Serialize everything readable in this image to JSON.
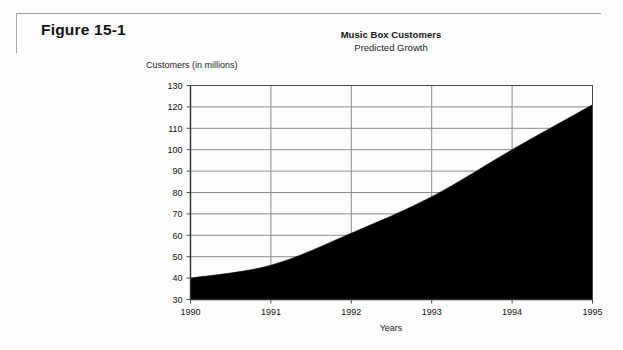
{
  "figure": {
    "label": "Figure 15-1"
  },
  "chart_data": {
    "type": "area",
    "title": "Music Box Customers",
    "subtitle": "Predicted Growth",
    "xlabel": "Years",
    "ylabel": "Customers (in millions)",
    "categories": [
      "1990",
      "1991",
      "1992",
      "1993",
      "1994",
      "1995"
    ],
    "x": [
      1990,
      1991,
      1992,
      1993,
      1994,
      1995
    ],
    "values": [
      40,
      46,
      61,
      78,
      100,
      121
    ],
    "series": [
      {
        "name": "Music Box Customers",
        "values": [
          40,
          46,
          61,
          78,
          100,
          121
        ]
      }
    ],
    "xlim": [
      1990,
      1995
    ],
    "ylim": [
      30,
      130
    ],
    "ytick_labels": [
      "130",
      "120",
      "110",
      "100",
      "90",
      "80",
      "70",
      "60",
      "50",
      "40",
      "30"
    ],
    "ytick_values": [
      130,
      120,
      110,
      100,
      90,
      80,
      70,
      60,
      50,
      40,
      30
    ],
    "xtick_labels": [
      "1990",
      "1991",
      "1992",
      "1993",
      "1994",
      "1995"
    ],
    "grid": "both",
    "legend": "none",
    "fill_color": "#000000",
    "grid_color": "#8a8a8a",
    "axis_color": "#4a4a4a",
    "background": "#ffffff"
  }
}
